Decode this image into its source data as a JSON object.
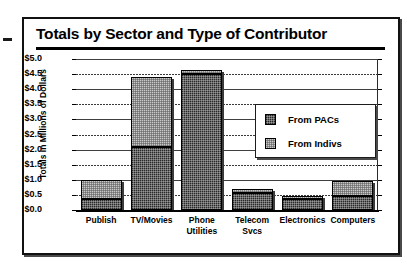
{
  "chart_data": {
    "type": "bar",
    "stacked": true,
    "title": "Totals by Sector and Type of Contributor",
    "xlabel": "",
    "ylabel": "Totals in Millions of Dollars",
    "ylim": [
      0.0,
      5.0
    ],
    "ytick_step": 0.5,
    "grid": true,
    "legend_position": "inside-right",
    "categories": [
      "Publish",
      "TV/Movies",
      "Phone Utilities",
      "Telecom Svcs",
      "Electronics",
      "Computers"
    ],
    "ytick_labels": [
      "$0.0",
      "$0.5",
      "$1.0",
      "$1.5",
      "$2.0",
      "$2.5",
      "$3.0",
      "$3.5",
      "$4.0",
      "$4.5",
      "$5.0"
    ],
    "series": [
      {
        "name": "From PACs",
        "color": "#2a2a2a",
        "values": [
          0.35,
          2.1,
          4.5,
          0.55,
          0.35,
          0.45
        ]
      },
      {
        "name": "From Indivs",
        "color": "#c9c9c9",
        "values": [
          0.65,
          2.3,
          0.15,
          0.15,
          0.1,
          0.5
        ]
      }
    ],
    "totals": [
      1.0,
      4.4,
      4.65,
      0.7,
      0.45,
      0.95
    ]
  },
  "legend": {
    "items": [
      {
        "label": "From PACs",
        "swatch": "dark-checker-swatch"
      },
      {
        "label": "From Indivs",
        "swatch": "light-checker-swatch"
      }
    ]
  }
}
